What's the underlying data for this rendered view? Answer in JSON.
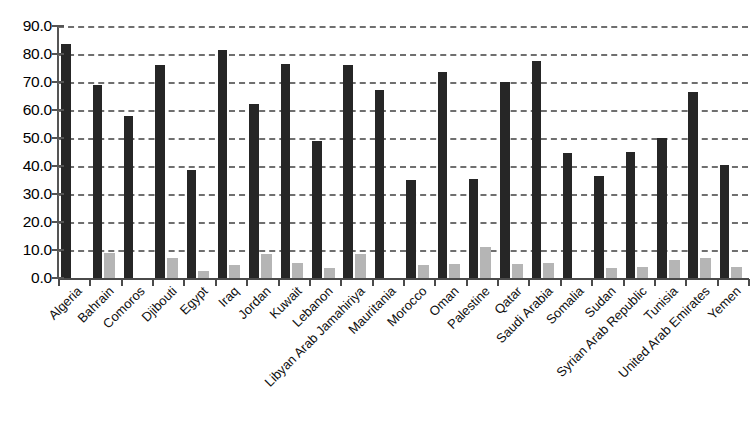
{
  "chart_data": {
    "type": "bar",
    "title": "",
    "subtitle": "",
    "xlabel": "",
    "ylabel": "",
    "ylim": [
      0,
      90
    ],
    "ytick_labels": [
      "90.0",
      "80.0",
      "70.0",
      "60.0",
      "50.0",
      "40.0",
      "30.0",
      "20.0",
      "10.0",
      "0.0"
    ],
    "ytick_values": [
      90,
      80,
      70,
      60,
      50,
      40,
      30,
      20,
      10,
      0
    ],
    "grid": true,
    "grid_style": "dashed-horizontal",
    "legend": "none",
    "legend_position": "none",
    "categories": [
      "Algeria",
      "Bahrain",
      "Comoros",
      "Djibouti",
      "Egypt",
      "Iraq",
      "Jordan",
      "Kuwait",
      "Lebanon",
      "Libyan Arab Jamahiriya",
      "Mauritania",
      "Morocco",
      "Oman",
      "Palestine",
      "Qatar",
      "Saudi Arabia",
      "Somalia",
      "Sudan",
      "Syrian Arab Republic",
      "Tunisia",
      "United Arab Emirates",
      "Yemen"
    ],
    "series": [
      {
        "name": "series-1",
        "color": "#262626",
        "values": [
          83.5,
          69.0,
          58.0,
          76.0,
          38.5,
          81.5,
          62.0,
          76.5,
          49.0,
          76.0,
          67.0,
          35.0,
          73.5,
          35.5,
          70.0,
          77.5,
          44.5,
          36.5,
          45.0,
          50.0,
          66.5,
          40.5
        ]
      },
      {
        "name": "series-2",
        "color": "#b5b5b5",
        "values": [
          0,
          9.0,
          0,
          7.0,
          2.5,
          4.5,
          8.5,
          5.5,
          3.5,
          8.5,
          0,
          4.5,
          5.0,
          11.0,
          5.0,
          5.5,
          0,
          3.5,
          4.0,
          6.5,
          7.0,
          4.0
        ]
      }
    ]
  }
}
